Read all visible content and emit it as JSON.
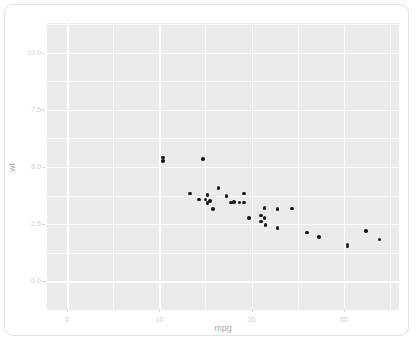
{
  "chart_data": {
    "type": "scatter",
    "title": "",
    "xlabel": "mpg",
    "ylabel": "wt",
    "xlim": [
      -2.2,
      36.0
    ],
    "ylim": [
      -1.3,
      11.3
    ],
    "grid": true,
    "legend": null,
    "x_ticks": [
      0,
      10,
      20,
      30
    ],
    "x_tick_labels": [
      "0",
      "10",
      "20",
      "30"
    ],
    "y_ticks": [
      0.0,
      2.5,
      5.0,
      7.5,
      10.0
    ],
    "y_tick_labels": [
      "0.0",
      "2.5",
      "5.0",
      "7.5",
      "10.0"
    ],
    "x_minor_ticks": [
      5,
      15,
      25,
      35
    ],
    "y_minor_ticks": [
      -1.25,
      1.25,
      3.75,
      6.25,
      8.75,
      11.25
    ],
    "point_color": "#1a1a1a",
    "panel_background": "#ebebeb",
    "gridline_color": "#ffffff",
    "series": [
      {
        "name": "mtcars",
        "x": [
          21.0,
          21.0,
          22.8,
          21.4,
          18.7,
          18.1,
          14.3,
          24.4,
          22.8,
          19.2,
          17.8,
          16.4,
          17.3,
          15.2,
          10.4,
          10.4,
          14.7,
          32.4,
          30.4,
          33.9,
          21.5,
          15.5,
          15.2,
          13.3,
          19.2,
          27.3,
          26.0,
          30.4,
          15.8,
          19.7,
          15.0,
          21.4
        ],
        "y": [
          2.62,
          2.875,
          2.32,
          3.215,
          3.44,
          3.46,
          3.57,
          3.19,
          3.15,
          3.44,
          3.44,
          4.07,
          3.73,
          3.78,
          5.25,
          5.424,
          5.345,
          2.2,
          1.615,
          1.835,
          2.465,
          3.52,
          3.435,
          3.84,
          3.845,
          1.935,
          2.14,
          1.513,
          3.17,
          2.77,
          3.57,
          2.78
        ]
      }
    ]
  },
  "axes": {
    "x_title": "mpg",
    "y_title": "wt"
  }
}
